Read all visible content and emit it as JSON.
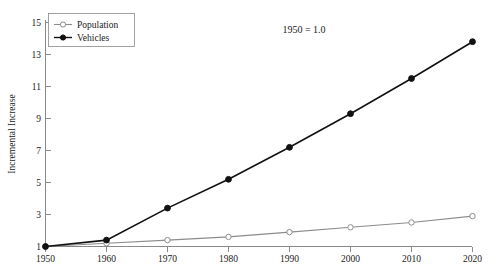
{
  "chart_data": {
    "type": "line",
    "title": "",
    "subtitle": "",
    "xlabel": "",
    "ylabel": "Incremental Increase",
    "x": [
      1950,
      1960,
      1970,
      1980,
      1990,
      2000,
      2010,
      2020
    ],
    "categories": [
      "1950",
      "1960",
      "1970",
      "1980",
      "1990",
      "2000",
      "2010",
      "2020"
    ],
    "series": [
      {
        "name": "Population",
        "values": [
          1.0,
          1.2,
          1.4,
          1.6,
          1.9,
          2.2,
          2.5,
          2.9
        ],
        "color": "#8c8c8c",
        "marker": "open-circle"
      },
      {
        "name": "Vehicles",
        "values": [
          1.0,
          1.4,
          3.4,
          5.2,
          7.2,
          9.3,
          11.5,
          13.8
        ],
        "color": "#111111",
        "marker": "filled-circle"
      }
    ],
    "ylim": [
      1,
      15
    ],
    "yticks": [
      1,
      3,
      5,
      7,
      9,
      11,
      13,
      15
    ],
    "ytick_labels": [
      "1",
      "3",
      "5",
      "7",
      "9",
      "11",
      "13",
      "15"
    ],
    "xlim": [
      1950,
      2020
    ],
    "xticks": [
      1950,
      1960,
      1970,
      1980,
      1990,
      2000,
      2010,
      2020
    ],
    "xtick_labels": [
      "1950",
      "1960",
      "1970",
      "1980",
      "1990",
      "2000",
      "2010",
      "2020"
    ],
    "grid": false,
    "legend_position": "top-left",
    "annotations": [
      {
        "text": "1950 = 1.0",
        "x": 1987,
        "y": 14.3
      }
    ]
  },
  "axes": {
    "y_title": "Incremental Increase",
    "y_ticks": [
      "1",
      "3",
      "5",
      "7",
      "9",
      "11",
      "13",
      "15"
    ],
    "x_ticks": [
      "1950",
      "1960",
      "1970",
      "1980",
      "1990",
      "2000",
      "2010",
      "2020"
    ]
  },
  "legend": {
    "entries": [
      {
        "label": "Population",
        "marker": "open-circle"
      },
      {
        "label": "Vehicles",
        "marker": "filled-circle"
      }
    ]
  },
  "annotation": {
    "normalization_note": "1950 = 1.0"
  },
  "caption": {
    "text": ""
  },
  "colors": {
    "population_line": "#8c8c8c",
    "vehicles_line": "#111111",
    "axis": "#8a8a8a",
    "text": "#1a1a1a",
    "background": "#ffffff"
  }
}
